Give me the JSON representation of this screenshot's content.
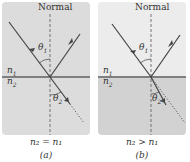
{
  "panels": [
    {
      "id": "a",
      "normal_label": "Normal",
      "upper_medium": "n1",
      "lower_medium": "n2",
      "incident_angle_label": "θ1",
      "refracted_angle_label": "θ2",
      "relation": "n2 = n1",
      "caption": "(a)",
      "colors": {
        "upper": "#dcdcdc",
        "lower": "#dcdcdc",
        "interface": "#7f7f7f"
      }
    },
    {
      "id": "b",
      "normal_label": "Normal",
      "upper_medium": "n1",
      "lower_medium": "n2",
      "incident_angle_label": "θ1",
      "refracted_angle_label": "θ2",
      "relation": "n2 > n1",
      "caption": "(b)",
      "colors": {
        "upper": "#ececec",
        "lower": "#d2d2d2",
        "interface": "#7f7f7f"
      }
    }
  ],
  "labels": {
    "a_normal": "Normal",
    "a_n1": "n",
    "a_n1_sub": "1",
    "a_n2": "n",
    "a_n2_sub": "2",
    "a_theta1": "θ",
    "a_theta1_sub": "1",
    "a_theta2": "θ",
    "a_theta2_sub": "2",
    "a_relation": "n₂ = n₁",
    "a_caption": "(a)",
    "b_normal": "Normal",
    "b_n1": "n",
    "b_n1_sub": "1",
    "b_n2": "n",
    "b_n2_sub": "2",
    "b_theta1": "θ",
    "b_theta1_sub": "1",
    "b_theta2": "θ",
    "b_theta2_sub": "2",
    "b_relation": "n₂ > n₁",
    "b_caption": "(b)"
  }
}
